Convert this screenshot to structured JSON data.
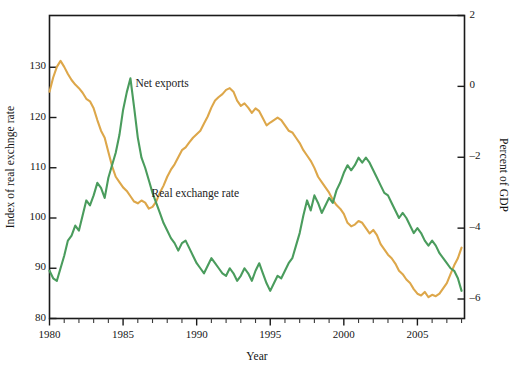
{
  "chart_data": {
    "type": "line",
    "title": "",
    "xlabel": "Year",
    "y_left_label": "Index of real exchnge rate",
    "y_right_label": "Percent of GDP",
    "xlim": [
      1980,
      2008.2
    ],
    "ylim_left": [
      80,
      140.3
    ],
    "ylim_right": [
      -6.55,
      2.0
    ],
    "grid": false,
    "legend_position": "inline-annotations",
    "x_ticks_major": [
      1980,
      1985,
      1990,
      1995,
      2000,
      2005
    ],
    "x_ticks_minor_step": 1,
    "y_left_ticks": [
      80,
      90,
      100,
      110,
      120,
      130
    ],
    "y_right_ticks": [
      -6,
      -4,
      -2,
      0,
      2
    ],
    "series": [
      {
        "name": "Net exports",
        "axis": "right",
        "color": "#DDA74A",
        "units": "Percent of GDP",
        "x": [
          1980.0,
          1980.25,
          1980.5,
          1980.75,
          1981.0,
          1981.25,
          1981.5,
          1981.75,
          1982.0,
          1982.25,
          1982.5,
          1982.75,
          1983.0,
          1983.25,
          1983.5,
          1983.75,
          1984.0,
          1984.25,
          1984.5,
          1984.75,
          1985.0,
          1985.25,
          1985.5,
          1985.75,
          1986.0,
          1986.25,
          1986.5,
          1986.75,
          1987.0,
          1987.25,
          1987.5,
          1987.75,
          1988.0,
          1988.25,
          1988.5,
          1988.75,
          1989.0,
          1989.25,
          1989.5,
          1989.75,
          1990.0,
          1990.25,
          1990.5,
          1990.75,
          1991.0,
          1991.25,
          1991.5,
          1991.75,
          1992.0,
          1992.25,
          1992.5,
          1992.75,
          1993.0,
          1993.25,
          1993.5,
          1993.75,
          1994.0,
          1994.25,
          1994.5,
          1994.75,
          1995.0,
          1995.25,
          1995.5,
          1995.75,
          1996.0,
          1996.25,
          1996.5,
          1996.75,
          1997.0,
          1997.25,
          1997.5,
          1997.75,
          1998.0,
          1998.25,
          1998.5,
          1998.75,
          1999.0,
          1999.25,
          1999.5,
          1999.75,
          2000.0,
          2000.25,
          2000.5,
          2000.75,
          2001.0,
          2001.25,
          2001.5,
          2001.75,
          2002.0,
          2002.25,
          2002.5,
          2002.75,
          2003.0,
          2003.25,
          2003.5,
          2003.75,
          2004.0,
          2004.25,
          2004.5,
          2004.75,
          2005.0,
          2005.25,
          2005.5,
          2005.75,
          2006.0,
          2006.25,
          2006.5,
          2006.75,
          2007.0,
          2007.25,
          2007.5,
          2007.75,
          2008.0
        ],
        "values": [
          -0.15,
          0.25,
          0.55,
          0.72,
          0.55,
          0.35,
          0.18,
          0.05,
          -0.05,
          -0.18,
          -0.35,
          -0.42,
          -0.62,
          -0.95,
          -1.25,
          -1.45,
          -1.85,
          -2.25,
          -2.55,
          -2.7,
          -2.85,
          -2.95,
          -3.1,
          -3.25,
          -3.3,
          -3.22,
          -3.28,
          -3.45,
          -3.4,
          -3.25,
          -3.0,
          -2.8,
          -2.55,
          -2.35,
          -2.2,
          -2.0,
          -1.8,
          -1.72,
          -1.58,
          -1.45,
          -1.35,
          -1.25,
          -1.05,
          -0.85,
          -0.6,
          -0.4,
          -0.3,
          -0.22,
          -0.1,
          -0.05,
          -0.15,
          -0.4,
          -0.55,
          -0.48,
          -0.6,
          -0.75,
          -0.62,
          -0.7,
          -0.9,
          -1.1,
          -1.02,
          -0.95,
          -0.88,
          -0.95,
          -1.1,
          -1.25,
          -1.3,
          -1.45,
          -1.6,
          -1.8,
          -1.95,
          -2.1,
          -2.3,
          -2.55,
          -2.7,
          -2.85,
          -3.0,
          -3.2,
          -3.35,
          -3.45,
          -3.6,
          -3.85,
          -3.95,
          -3.9,
          -3.8,
          -3.85,
          -4.0,
          -4.15,
          -4.05,
          -4.2,
          -4.45,
          -4.6,
          -4.75,
          -4.85,
          -5.0,
          -5.2,
          -5.3,
          -5.45,
          -5.55,
          -5.72,
          -5.85,
          -5.9,
          -5.8,
          -5.95,
          -5.88,
          -5.92,
          -5.85,
          -5.7,
          -5.55,
          -5.3,
          -5.05,
          -4.85,
          -4.55
        ]
      },
      {
        "name": "Real exchange rate",
        "axis": "left",
        "color": "#4A9C5D",
        "units": "Index of real exchange rate",
        "x": [
          1980.0,
          1980.25,
          1980.5,
          1980.75,
          1981.0,
          1981.25,
          1981.5,
          1981.75,
          1982.0,
          1982.25,
          1982.5,
          1982.75,
          1983.0,
          1983.25,
          1983.5,
          1983.75,
          1984.0,
          1984.25,
          1984.5,
          1984.75,
          1985.0,
          1985.25,
          1985.5,
          1985.75,
          1986.0,
          1986.25,
          1986.5,
          1986.75,
          1987.0,
          1987.25,
          1987.5,
          1987.75,
          1988.0,
          1988.25,
          1988.5,
          1988.75,
          1989.0,
          1989.25,
          1989.5,
          1989.75,
          1990.0,
          1990.25,
          1990.5,
          1990.75,
          1991.0,
          1991.25,
          1991.5,
          1991.75,
          1992.0,
          1992.25,
          1992.5,
          1992.75,
          1993.0,
          1993.25,
          1993.5,
          1993.75,
          1994.0,
          1994.25,
          1994.5,
          1994.75,
          1995.0,
          1995.25,
          1995.5,
          1995.75,
          1996.0,
          1996.25,
          1996.5,
          1996.75,
          1997.0,
          1997.25,
          1997.5,
          1997.75,
          1998.0,
          1998.25,
          1998.5,
          1998.75,
          1999.0,
          1999.25,
          1999.5,
          1999.75,
          2000.0,
          2000.25,
          2000.5,
          2000.75,
          2001.0,
          2001.25,
          2001.5,
          2001.75,
          2002.0,
          2002.25,
          2002.5,
          2002.75,
          2003.0,
          2003.25,
          2003.5,
          2003.75,
          2004.0,
          2004.25,
          2004.5,
          2004.75,
          2005.0,
          2005.25,
          2005.5,
          2005.75,
          2006.0,
          2006.25,
          2006.5,
          2006.75,
          2007.0,
          2007.25,
          2007.5,
          2007.75,
          2008.0
        ],
        "values": [
          89.5,
          88.0,
          87.5,
          90.0,
          92.5,
          95.5,
          96.5,
          98.5,
          97.5,
          100.5,
          103.5,
          102.5,
          104.5,
          107.0,
          106.0,
          104.0,
          108.0,
          110.5,
          113.0,
          116.5,
          121.5,
          125.0,
          127.8,
          122.0,
          116.0,
          112.0,
          110.0,
          107.5,
          105.0,
          103.0,
          101.0,
          99.0,
          97.5,
          96.0,
          95.0,
          93.5,
          95.0,
          95.5,
          94.0,
          92.5,
          91.0,
          90.0,
          89.0,
          90.5,
          92.0,
          91.0,
          90.0,
          89.0,
          88.5,
          90.0,
          89.0,
          87.5,
          88.5,
          90.0,
          89.0,
          87.5,
          89.5,
          91.0,
          89.0,
          87.0,
          85.5,
          87.0,
          88.5,
          88.0,
          89.5,
          91.0,
          92.0,
          94.5,
          97.0,
          100.5,
          103.5,
          101.5,
          104.5,
          103.0,
          101.0,
          102.5,
          104.0,
          103.0,
          105.5,
          107.0,
          109.0,
          110.5,
          109.5,
          110.5,
          112.0,
          111.0,
          112.0,
          111.0,
          109.5,
          108.0,
          106.5,
          105.0,
          104.5,
          103.0,
          101.5,
          100.0,
          101.0,
          100.0,
          98.5,
          97.0,
          98.0,
          97.0,
          95.5,
          94.5,
          95.5,
          94.5,
          93.0,
          92.0,
          91.0,
          90.0,
          89.5,
          88.0,
          85.5
        ]
      }
    ],
    "annotations": [
      {
        "text": "Net exports",
        "x": 1989.1,
        "y_right": 0.05
      },
      {
        "text": "Real exchange rate",
        "x": 1990.2,
        "y_left": 104.5
      }
    ]
  }
}
